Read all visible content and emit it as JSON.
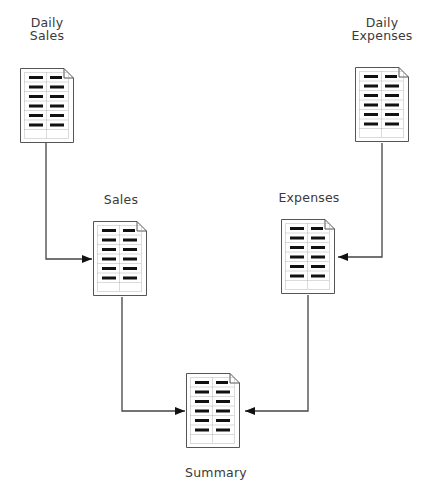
{
  "diagram": {
    "type": "data-flow",
    "nodes": [
      {
        "id": "daily_sales",
        "label_line1": "Daily",
        "label_line2": "Sales",
        "icon": "spreadsheet-document-icon"
      },
      {
        "id": "daily_expenses",
        "label_line1": "Daily",
        "label_line2": "Expenses",
        "icon": "spreadsheet-document-icon"
      },
      {
        "id": "sales",
        "label": "Sales",
        "icon": "spreadsheet-document-icon"
      },
      {
        "id": "expenses",
        "label": "Expenses",
        "icon": "spreadsheet-document-icon"
      },
      {
        "id": "summary",
        "label": "Summary",
        "icon": "spreadsheet-document-icon"
      }
    ],
    "edges": [
      {
        "from": "daily_sales",
        "to": "sales"
      },
      {
        "from": "daily_expenses",
        "to": "expenses"
      },
      {
        "from": "sales",
        "to": "summary"
      },
      {
        "from": "expenses",
        "to": "summary"
      }
    ],
    "colors": {
      "line": "#444444",
      "doc_border": "#555555",
      "doc_bar": "#111111",
      "grid": "#999999"
    }
  }
}
